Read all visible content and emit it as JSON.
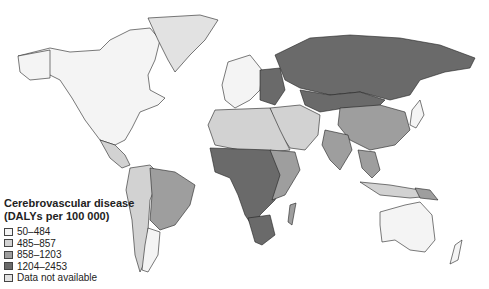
{
  "map": {
    "title_line1": "Cerebrovascular disease",
    "title_line2": "(DALYs per 100 000)",
    "legend": [
      {
        "label": "50–484",
        "color": "#f4f4f4"
      },
      {
        "label": "485–857",
        "color": "#d2d2d2"
      },
      {
        "label": "858–1203",
        "color": "#9e9e9e"
      },
      {
        "label": "1204–2453",
        "color": "#6a6a6a"
      },
      {
        "label": "Data not available",
        "color": "#e2e2e2"
      }
    ],
    "regions": {
      "north_america": "50–484",
      "greenland": "Data not available",
      "south_america_brazil": "858–1203",
      "south_america_other": "485–857",
      "western_europe": "50–484",
      "russia": "1204–2453",
      "china": "858–1203",
      "india": "858–1203",
      "central_africa": "1204–2453",
      "southern_africa": "1204–2453",
      "australia": "50–484",
      "new_zealand": "50–484",
      "japan": "50–484",
      "mongolia_kazakhstan": "1204–2453",
      "middle_east": "485–857",
      "southeast_asia": "858–1203"
    }
  }
}
